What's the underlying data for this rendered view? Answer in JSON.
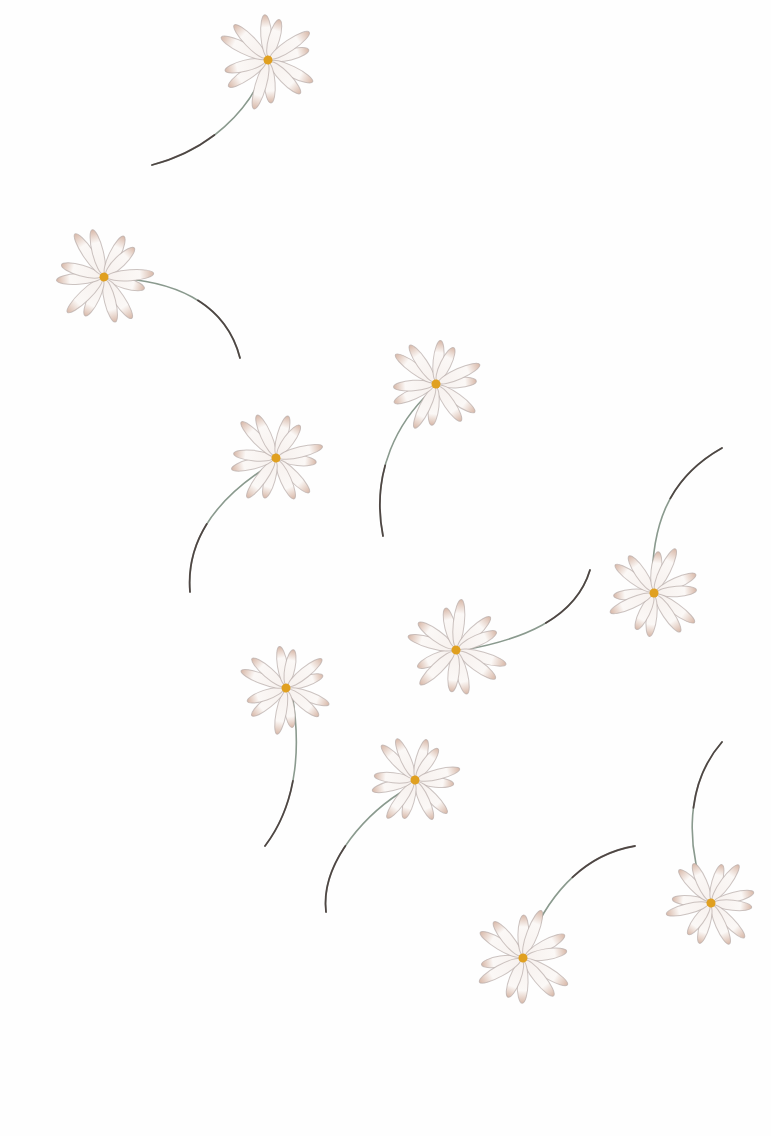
{
  "artwork": {
    "subject": "scattered daisies with long curved stems, watercolor",
    "background": "#fefefe",
    "colors": {
      "petal_fill": "#f7f1ee",
      "petal_stroke": "#b7aba8",
      "petal_tint": "#d8b8a8",
      "center": "#e0a020",
      "stem": "#8a9a8e",
      "stem_dark": "#3a2a2a"
    }
  },
  "flowers": [
    {
      "cx": 268,
      "cy": 60,
      "r": 50,
      "rot": -10,
      "stem": "M265,68 C250,110 210,150 152,165"
    },
    {
      "cx": 104,
      "cy": 277,
      "r": 50,
      "rot": 20,
      "stem": "M112,278 C170,280 225,300 240,358"
    },
    {
      "cx": 436,
      "cy": 384,
      "r": 48,
      "rot": 0,
      "stem": "M430,392 C400,420 370,470 383,536"
    },
    {
      "cx": 276,
      "cy": 458,
      "r": 48,
      "rot": 10,
      "stem": "M270,465 C230,490 185,530 190,592"
    },
    {
      "cx": 654,
      "cy": 593,
      "r": 48,
      "rot": 180,
      "stem": "M652,585 C652,530 665,480 722,448"
    },
    {
      "cx": 456,
      "cy": 650,
      "r": 50,
      "rot": 160,
      "stem": "M464,650 C520,640 575,620 590,570"
    },
    {
      "cx": 286,
      "cy": 688,
      "r": 46,
      "rot": -15,
      "stem": "M292,694 C300,740 300,800 265,846"
    },
    {
      "cx": 415,
      "cy": 780,
      "r": 46,
      "rot": 10,
      "stem": "M408,788 C370,810 320,860 326,912"
    },
    {
      "cx": 711,
      "cy": 903,
      "r": 46,
      "rot": 190,
      "stem": "M706,895 C690,860 680,790 722,742"
    },
    {
      "cx": 523,
      "cy": 958,
      "r": 50,
      "rot": 175,
      "stem": "M526,950 C545,900 580,855 635,846"
    }
  ]
}
